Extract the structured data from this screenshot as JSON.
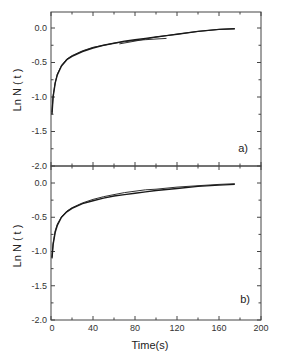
{
  "chart_data": [
    {
      "type": "line",
      "panel_label": "a)",
      "xlabel": "Time(s)",
      "ylabel": "Ln N ( t )",
      "xlim": [
        0,
        200
      ],
      "ylim": [
        -2.0,
        0.25
      ],
      "yticks": [
        "0.0",
        "-0.5",
        "-1.0",
        "-1.5",
        "-2.0"
      ],
      "grid": false,
      "series": [
        {
          "name": "experimental",
          "x": [
            1,
            2,
            4,
            6,
            10,
            15,
            20,
            30,
            40,
            50,
            60,
            70,
            80,
            90,
            100,
            110,
            120,
            140,
            160,
            175
          ],
          "y": [
            -1.25,
            -1.0,
            -0.8,
            -0.68,
            -0.55,
            -0.46,
            -0.41,
            -0.34,
            -0.29,
            -0.25,
            -0.22,
            -0.19,
            -0.17,
            -0.15,
            -0.13,
            -0.11,
            -0.09,
            -0.05,
            -0.02,
            -0.01
          ]
        },
        {
          "name": "fit",
          "x": [
            1,
            2,
            4,
            6,
            10,
            15,
            20,
            30,
            40,
            50,
            60,
            70,
            80,
            90,
            100,
            110
          ],
          "y": [
            -1.22,
            -0.98,
            -0.79,
            -0.67,
            -0.54,
            -0.45,
            -0.4,
            -0.33,
            -0.28,
            -0.25,
            -0.22,
            -0.2,
            -0.18,
            -0.17,
            -0.16,
            -0.15
          ]
        },
        {
          "name": "fit-2",
          "x": [
            65,
            80,
            100,
            120,
            140,
            160,
            175
          ],
          "y": [
            -0.23,
            -0.19,
            -0.13,
            -0.09,
            -0.05,
            -0.02,
            -0.01
          ]
        }
      ]
    },
    {
      "type": "line",
      "panel_label": "b)",
      "xlabel": "Time(s)",
      "ylabel": "Ln N ( t )",
      "xlim": [
        0,
        200
      ],
      "ylim": [
        -2.0,
        0.05
      ],
      "xticks": [
        "0",
        "40",
        "80",
        "120",
        "160",
        "200"
      ],
      "yticks": [
        "0.0",
        "-0.5",
        "-1.0",
        "-1.5",
        "-2.0"
      ],
      "grid": false,
      "series": [
        {
          "name": "experimental",
          "x": [
            1,
            2,
            4,
            6,
            10,
            15,
            20,
            30,
            40,
            50,
            60,
            70,
            80,
            90,
            100,
            120,
            140,
            160,
            175
          ],
          "y": [
            -1.1,
            -0.9,
            -0.72,
            -0.62,
            -0.5,
            -0.42,
            -0.37,
            -0.3,
            -0.26,
            -0.22,
            -0.19,
            -0.17,
            -0.15,
            -0.13,
            -0.11,
            -0.08,
            -0.05,
            -0.03,
            -0.02
          ]
        },
        {
          "name": "fit",
          "x": [
            1,
            2,
            4,
            6,
            10,
            15,
            20,
            30,
            40,
            50,
            60,
            70,
            80,
            90,
            100,
            120,
            140,
            160,
            175
          ],
          "y": [
            -1.08,
            -0.88,
            -0.7,
            -0.6,
            -0.49,
            -0.41,
            -0.36,
            -0.29,
            -0.24,
            -0.2,
            -0.17,
            -0.14,
            -0.12,
            -0.1,
            -0.09,
            -0.06,
            -0.04,
            -0.02,
            -0.01
          ]
        }
      ]
    }
  ],
  "labels": {
    "panel_a": "a)",
    "panel_b": "b)",
    "ylabel": "Ln N ( t )",
    "xlabel": "Time(s)",
    "yticks": [
      "0.0",
      "-0.5",
      "-1.0",
      "-1.5",
      "-2.0"
    ],
    "xticks": [
      "0",
      "40",
      "80",
      "120",
      "160",
      "200"
    ]
  }
}
